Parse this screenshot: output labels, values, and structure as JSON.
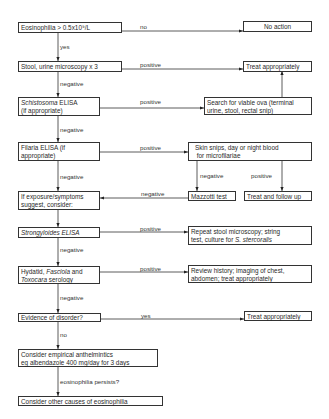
{
  "boxes": {
    "eosinophilia": "Eosinophilia > 0.5x10⁹/L",
    "no_action": "No action",
    "stool": "Stool, urine microscopy x 3",
    "treat1": "Treat appropriately",
    "schisto_1": "Schistosoma",
    "schisto_2": " ELISA",
    "schisto_3": "(if appropriate)",
    "search_1": "Search for viable ova (terminal",
    "search_2": "urine, stool, rectal snip)",
    "filaria_1": "Filaria ELISA (if",
    "filaria_2": "appropriate)",
    "skin_1": "Skin snips, day or night blood",
    "skin_2": "for microfilariae",
    "mazzotti": "Mazzotti test",
    "treat_follow": "Treat and follow up",
    "exposure_1": "If exposure/symptoms",
    "exposure_2": "suggest, consider:",
    "strongy": "Strongyloides ELISA",
    "repeat_1": "Repeat stool microscopy; string",
    "repeat_2": "test, culture for ",
    "repeat_3": "S. stercoralis",
    "hydatid_1": "Hydatid, ",
    "hydatid_2": "Fasciola",
    "hydatid_3": " and",
    "hydatid_4": "Toxocara",
    "hydatid_5": " serology",
    "review_1": "Review history; imaging of chest,",
    "review_2": "abdomen; treat appropriately",
    "evidence": "Evidence of disorder?",
    "treat2": "Treat appropriately",
    "empirical_1": "Consider empirical anthelmintics",
    "empirical_2": "eg albendazole 400 mg/day for 3 days",
    "other": "Consider other causes of eosinophilia"
  },
  "labels": {
    "no1": "no",
    "yes1": "yes",
    "pos1": "positive",
    "neg1": "negative",
    "pos2": "positive",
    "neg2": "negative",
    "pos3": "positive",
    "neg3": "negative",
    "neg_maz": "negative",
    "pos_skin": "positive",
    "neg_back": "negative",
    "pos4": "positive",
    "neg4": "negative",
    "pos5": "positive",
    "neg5": "negative",
    "yes2": "yes",
    "no2": "no",
    "persists": "eosinophilia persists?"
  }
}
